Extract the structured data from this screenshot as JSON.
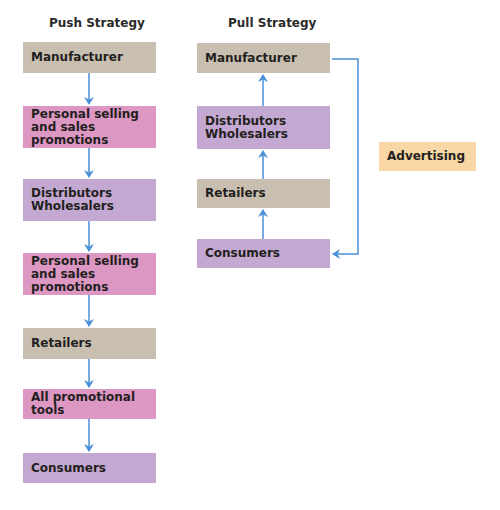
{
  "push": {
    "title": "Push Strategy",
    "boxes": [
      {
        "label": "Manufacturer",
        "color": "tan"
      },
      {
        "label": "Personal selling\nand sales promotions",
        "color": "pink"
      },
      {
        "label": "Distributors\nWholesalers",
        "color": "purple"
      },
      {
        "label": "Personal selling\nand sales promotions",
        "color": "pink"
      },
      {
        "label": "Retailers",
        "color": "tan"
      },
      {
        "label": "All promotional tools",
        "color": "pink"
      },
      {
        "label": "Consumers",
        "color": "purple"
      }
    ]
  },
  "pull": {
    "title": "Pull Strategy",
    "boxes": [
      {
        "label": "Manufacturer",
        "color": "tan"
      },
      {
        "label": "Distributors\nWholesalers",
        "color": "purple"
      },
      {
        "label": "Retailers",
        "color": "tan"
      },
      {
        "label": "Consumers",
        "color": "purple"
      }
    ]
  },
  "side": {
    "advertising": "Advertising"
  },
  "colors": {
    "tan": "#c9bfb1",
    "pink": "#dd97c3",
    "purple": "#c3a9d2",
    "orange": "#f8d6a5",
    "arrow": "#4a90d9"
  }
}
